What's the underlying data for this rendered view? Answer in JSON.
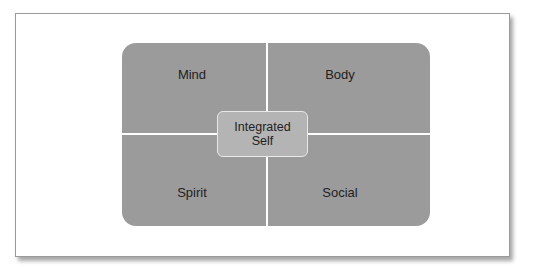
{
  "diagram": {
    "quadrants": [
      {
        "position": "top-left",
        "label": "Mind"
      },
      {
        "position": "top-right",
        "label": "Body"
      },
      {
        "position": "bottom-left",
        "label": "Spirit"
      },
      {
        "position": "bottom-right",
        "label": "Social"
      }
    ],
    "center": {
      "line1": "Integrated",
      "line2": "Self"
    },
    "colors": {
      "quadrant_fill": "#9b9b9b",
      "center_fill": "#b4b4b4",
      "divider": "#ffffff",
      "frame_border": "#9a9a9a"
    }
  }
}
